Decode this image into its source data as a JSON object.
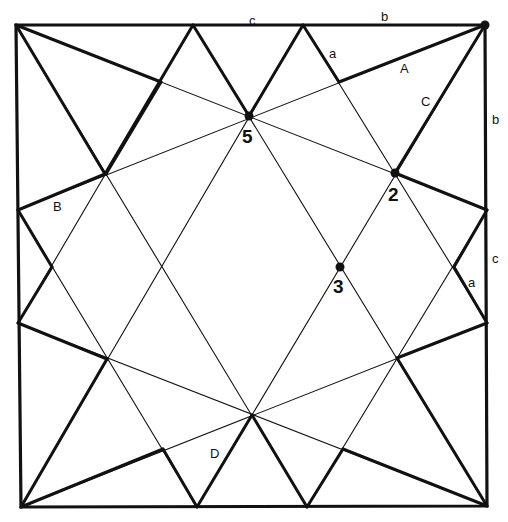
{
  "diagram": {
    "type": "geometric-construction",
    "frame": {
      "tl": [
        16,
        25
      ],
      "tr": [
        485,
        25
      ],
      "br": [
        487,
        506
      ],
      "bl": [
        21,
        507
      ]
    },
    "thin_lines": [
      [
        [
          16,
          25
        ],
        [
          487,
          210
        ]
      ],
      [
        [
          16,
          25
        ],
        [
          307,
          507
        ]
      ],
      [
        [
          485,
          25
        ],
        [
          18,
          210
        ]
      ],
      [
        [
          485,
          25
        ],
        [
          197,
          507
        ]
      ],
      [
        [
          21,
          507
        ],
        [
          303,
          25
        ]
      ],
      [
        [
          21,
          507
        ],
        [
          487,
          323
        ]
      ],
      [
        [
          487,
          506
        ],
        [
          193,
          25
        ]
      ],
      [
        [
          487,
          506
        ],
        [
          18,
          323
        ]
      ],
      [
        [
          18,
          323
        ],
        [
          193,
          25
        ]
      ],
      [
        [
          18,
          210
        ],
        [
          197,
          507
        ]
      ],
      [
        [
          487,
          210
        ],
        [
          307,
          507
        ]
      ],
      [
        [
          487,
          323
        ],
        [
          303,
          25
        ]
      ]
    ],
    "thick_segments": [
      [
        [
          16,
          25
        ],
        [
          161,
          82
        ]
      ],
      [
        [
          16,
          25
        ],
        [
          105,
          174
        ]
      ],
      [
        [
          193,
          25
        ],
        [
          105,
          174
        ]
      ],
      [
        [
          193,
          25
        ],
        [
          249,
          116
        ]
      ],
      [
        [
          303,
          25
        ],
        [
          249,
          116
        ]
      ],
      [
        [
          303,
          25
        ],
        [
          339,
          82
        ]
      ],
      [
        [
          339,
          82
        ],
        [
          485,
          25
        ]
      ],
      [
        [
          485,
          25
        ],
        [
          395,
          173
        ]
      ],
      [
        [
          395,
          173
        ],
        [
          487,
          210
        ]
      ],
      [
        [
          487,
          210
        ],
        [
          454,
          267
        ]
      ],
      [
        [
          454,
          267
        ],
        [
          487,
          323
        ]
      ],
      [
        [
          487,
          323
        ],
        [
          397,
          358
        ]
      ],
      [
        [
          397,
          358
        ],
        [
          487,
          506
        ]
      ],
      [
        [
          487,
          506
        ],
        [
          343,
          449
        ]
      ],
      [
        [
          343,
          449
        ],
        [
          307,
          507
        ]
      ],
      [
        [
          307,
          507
        ],
        [
          252,
          415
        ]
      ],
      [
        [
          252,
          415
        ],
        [
          197,
          507
        ]
      ],
      [
        [
          197,
          507
        ],
        [
          163,
          449
        ]
      ],
      [
        [
          163,
          449
        ],
        [
          21,
          507
        ]
      ],
      [
        [
          21,
          507
        ],
        [
          107,
          359
        ]
      ],
      [
        [
          107,
          359
        ],
        [
          18,
          323
        ]
      ],
      [
        [
          18,
          323
        ],
        [
          52,
          267
        ]
      ],
      [
        [
          52,
          267
        ],
        [
          18,
          210
        ]
      ],
      [
        [
          18,
          210
        ],
        [
          105,
          174
        ]
      ],
      [
        [
          106,
          174
        ],
        [
          161,
          82
        ]
      ]
    ],
    "dots": [
      [
        485,
        25
      ],
      [
        249,
        116
      ],
      [
        395,
        173
      ],
      [
        340,
        267
      ]
    ],
    "labels": [
      {
        "text": "c",
        "x": 249,
        "y": 14
      },
      {
        "text": "b",
        "x": 381,
        "y": 10
      },
      {
        "text": "a",
        "x": 329,
        "y": 47
      },
      {
        "text": "A",
        "x": 400,
        "y": 62
      },
      {
        "text": "C",
        "x": 421,
        "y": 95
      },
      {
        "text": "b",
        "x": 492,
        "y": 113
      },
      {
        "text": "B",
        "x": 53,
        "y": 200
      },
      {
        "text": "c",
        "x": 492,
        "y": 252
      },
      {
        "text": "a",
        "x": 468,
        "y": 276
      },
      {
        "text": "D",
        "x": 210,
        "y": 447
      }
    ],
    "points": [
      {
        "text": "5",
        "x": 242,
        "y": 127
      },
      {
        "text": "2",
        "x": 388,
        "y": 185
      },
      {
        "text": "3",
        "x": 333,
        "y": 277
      }
    ]
  }
}
